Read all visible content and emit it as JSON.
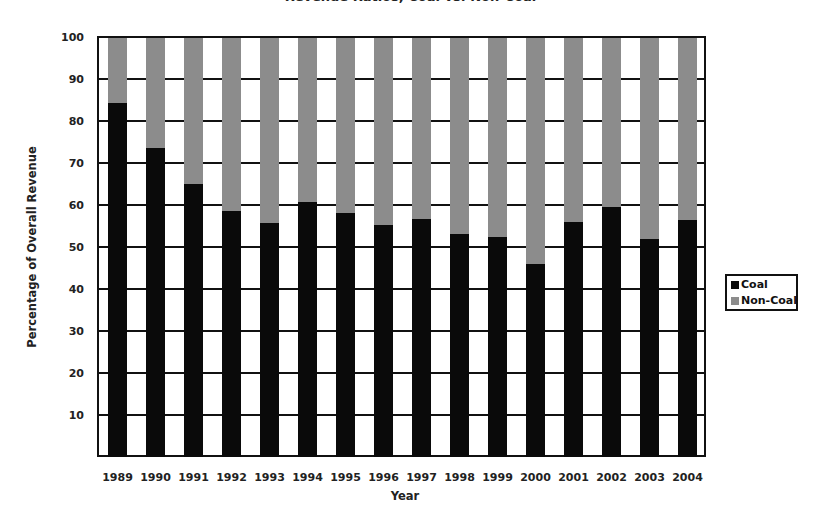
{
  "chart_data": {
    "type": "bar",
    "stacked": true,
    "title": "Revenue Ratios, Coal vs. Non-Coal",
    "xlabel": "Year",
    "ylabel": "Percentage of Overall Revenue",
    "ylim": [
      0,
      100
    ],
    "yticks": [
      10,
      20,
      30,
      40,
      50,
      60,
      70,
      80,
      90,
      100
    ],
    "grid": true,
    "legend_position": "right",
    "categories": [
      "1989",
      "1990",
      "1991",
      "1992",
      "1993",
      "1994",
      "1995",
      "1996",
      "1997",
      "1998",
      "1999",
      "2000",
      "2001",
      "2002",
      "2003",
      "2004"
    ],
    "series": [
      {
        "name": "Coal",
        "color": "#0a0a0a",
        "values": [
          84.3,
          73.6,
          65.0,
          58.6,
          55.8,
          60.8,
          58.0,
          55.2,
          56.6,
          53.0,
          52.4,
          46.0,
          56.0,
          59.5,
          52.0,
          56.4
        ]
      },
      {
        "name": "Non-Coal",
        "color": "#8c8c8c",
        "values": [
          15.7,
          26.4,
          35.0,
          41.4,
          44.2,
          39.2,
          42.0,
          44.8,
          43.4,
          47.0,
          47.6,
          54.0,
          44.0,
          40.5,
          48.0,
          43.6
        ]
      }
    ]
  },
  "legend": {
    "items": [
      {
        "label": "Coal",
        "color": "#0a0a0a"
      },
      {
        "label": "Non-Coal",
        "color": "#8c8c8c"
      }
    ]
  }
}
